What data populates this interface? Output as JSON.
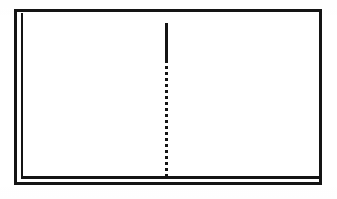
{
  "figure": {
    "kind": "line-art-diagram",
    "background_color": "#ffffff",
    "ink_color": "#141414",
    "canvas": {
      "width": 337,
      "height": 199
    },
    "has_text": false,
    "has_axis_labels": false,
    "has_tick_marks": false
  },
  "frame": {
    "name": "plot-frame",
    "left": 14,
    "top": 9,
    "right": 322,
    "bottom": 185,
    "stroke_width": 3,
    "style": "double-on-left-and-bottom",
    "rules": [
      {
        "name": "top-rule",
        "orientation": "horizontal",
        "x": 14,
        "y": 9,
        "length": 308,
        "thickness": 3
      },
      {
        "name": "right-rule",
        "orientation": "vertical",
        "x": 319,
        "y": 9,
        "length": 176,
        "thickness": 3
      },
      {
        "name": "outer-left-rule",
        "orientation": "vertical",
        "x": 14,
        "y": 9,
        "length": 176,
        "thickness": 3
      },
      {
        "name": "inner-left-rule",
        "orientation": "vertical",
        "x": 21,
        "y": 13,
        "length": 166,
        "thickness": 2
      },
      {
        "name": "inner-bottom-rule",
        "orientation": "horizontal",
        "x": 21,
        "y": 176,
        "length": 301,
        "thickness": 3
      },
      {
        "name": "outer-bottom-rule",
        "orientation": "horizontal",
        "x": 14,
        "y": 182,
        "length": 308,
        "thickness": 3
      }
    ]
  },
  "plot_area": {
    "name": "plot-interior",
    "left": 24,
    "top": 12,
    "width": 295,
    "height": 164,
    "fill": "#ffffff"
  },
  "divider": {
    "name": "vertical-divider-line",
    "x_center": 166,
    "thickness": 3,
    "top": 23,
    "bottom": 176,
    "solid_segment": {
      "from_y": 23,
      "to_y": 60,
      "length": 37
    },
    "dotted_segment": {
      "from_y": 60,
      "to_y": 176,
      "length": 116,
      "dot_height": 3,
      "dot_gap": 3,
      "period": 6,
      "approx_dot_count": 19
    }
  }
}
